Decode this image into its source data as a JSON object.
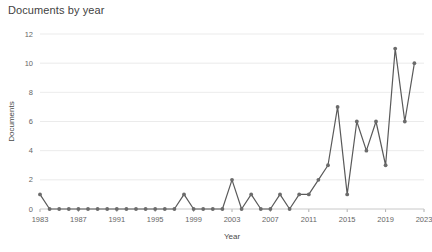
{
  "chart_data": {
    "type": "line",
    "title": "Documents by year",
    "xlabel": "Year",
    "ylabel": "Documents",
    "x": [
      1983,
      1984,
      1985,
      1986,
      1987,
      1988,
      1989,
      1990,
      1991,
      1992,
      1993,
      1994,
      1995,
      1996,
      1997,
      1998,
      1999,
      2000,
      2001,
      2002,
      2003,
      2004,
      2005,
      2006,
      2007,
      2008,
      2009,
      2010,
      2011,
      2012,
      2013,
      2014,
      2015,
      2016,
      2017,
      2018,
      2019,
      2020,
      2021,
      2022
    ],
    "values": [
      1,
      0,
      0,
      0,
      0,
      0,
      0,
      0,
      0,
      0,
      0,
      0,
      0,
      0,
      0,
      1,
      0,
      0,
      0,
      0,
      2,
      0,
      1,
      0,
      0,
      1,
      0,
      1,
      1,
      2,
      3,
      7,
      1,
      6,
      4,
      6,
      3,
      11,
      6,
      10
    ],
    "series": [
      {
        "name": "Documents",
        "values": [
          1,
          0,
          0,
          0,
          0,
          0,
          0,
          0,
          0,
          0,
          0,
          0,
          0,
          0,
          0,
          1,
          0,
          0,
          0,
          0,
          2,
          0,
          1,
          0,
          0,
          1,
          0,
          1,
          1,
          2,
          3,
          7,
          1,
          6,
          4,
          6,
          3,
          11,
          6,
          10
        ]
      }
    ],
    "xticks": [
      1983,
      1987,
      1991,
      1995,
      1999,
      2003,
      2007,
      2011,
      2015,
      2019,
      2023
    ],
    "xtick_labels": [
      "1983",
      "1987",
      "1991",
      "1995",
      "1999",
      "2003",
      "2007",
      "2011",
      "2015",
      "2019",
      "2023"
    ],
    "yticks": [
      0,
      2,
      4,
      6,
      8,
      10,
      12
    ],
    "ytick_labels": [
      "0",
      "2",
      "4",
      "6",
      "8",
      "10",
      "12"
    ],
    "xlim": [
      1983,
      2023
    ],
    "ylim": [
      0,
      12
    ],
    "grid": true,
    "legend": "none",
    "line_color": "#5a5a5a",
    "marker_color": "#6b6b6b",
    "grid_color": "#e6e6e6",
    "marker": "circle"
  },
  "colors": {
    "background": "#ffffff",
    "text": "#3f3f3f",
    "tick": "#666666",
    "line": "#5a5a5a",
    "grid": "#e6e6e6"
  }
}
